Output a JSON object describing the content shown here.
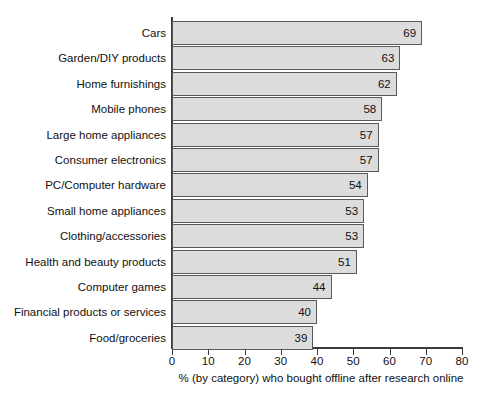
{
  "chart_data": {
    "type": "bar",
    "orientation": "horizontal",
    "title": "",
    "xlabel": "% (by category) who bought offline after research online",
    "ylabel": "",
    "xlim": [
      0,
      80
    ],
    "xticks": [
      0,
      10,
      20,
      30,
      40,
      50,
      60,
      70,
      80
    ],
    "grid": false,
    "legend": null,
    "categories": [
      "Cars",
      "Garden/DIY products",
      "Home furnishings",
      "Mobile phones",
      "Large home appliances",
      "Consumer electronics",
      "PC/Computer hardware",
      "Small home appliances",
      "Clothing/accessories",
      "Health and beauty products",
      "Computer games",
      "Financial products or services",
      "Food/groceries"
    ],
    "values": [
      69,
      63,
      62,
      58,
      57,
      57,
      54,
      53,
      53,
      51,
      44,
      40,
      39
    ],
    "colors": {
      "bar_fill": "#dcdcdc",
      "bar_edge": "#5a5a5a",
      "axis": "#3a3a3a",
      "text": "#111111",
      "background": "#ffffff"
    }
  }
}
